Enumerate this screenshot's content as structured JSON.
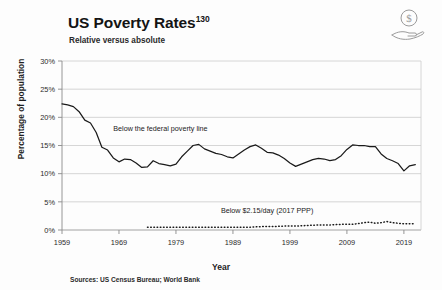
{
  "header": {
    "title": "US Poverty Rates",
    "title_superscript": "130",
    "subtitle": "Relative versus absolute",
    "icon": "hand-holding-dollar-icon"
  },
  "footer": {
    "sources": "Sources: US Census Bureau; World Bank"
  },
  "colors": {
    "background": "#fdfdfd",
    "line": "#1a1a1a",
    "gridline": "#cccccc",
    "axis": "#8a8a8a",
    "text": "#1a1a1a"
  },
  "chart_data": {
    "type": "line",
    "title": "US Poverty Rates",
    "subtitle": "Relative versus absolute",
    "xlabel": "Year",
    "ylabel": "Percentage of population",
    "xlim": [
      1959,
      2022
    ],
    "ylim": [
      0,
      30
    ],
    "xticks": [
      "1959",
      "1969",
      "1979",
      "1989",
      "1999",
      "2009",
      "2019"
    ],
    "xtick_values": [
      1959,
      1969,
      1979,
      1989,
      1999,
      2009,
      2019
    ],
    "yticks": [
      "0%",
      "5%",
      "10%",
      "15%",
      "20%",
      "25%",
      "30%"
    ],
    "ytick_values": [
      0,
      5,
      10,
      15,
      20,
      25,
      30
    ],
    "grid": "horizontal",
    "legend": "none",
    "annotations": [
      {
        "text": "Below the federal poverty line",
        "x": 1968,
        "y": 17.6
      },
      {
        "text": "Below $2.15/day (2017 PPP)",
        "x": 1995,
        "y": 3.1
      }
    ],
    "series": [
      {
        "name": "Below the federal poverty line",
        "style": "solid",
        "x": [
          1959,
          1960,
          1961,
          1962,
          1963,
          1964,
          1965,
          1966,
          1967,
          1968,
          1969,
          1970,
          1971,
          1972,
          1973,
          1974,
          1975,
          1976,
          1977,
          1978,
          1979,
          1980,
          1981,
          1982,
          1983,
          1984,
          1985,
          1986,
          1987,
          1988,
          1989,
          1990,
          1991,
          1992,
          1993,
          1994,
          1995,
          1996,
          1997,
          1998,
          1999,
          2000,
          2001,
          2002,
          2003,
          2004,
          2005,
          2006,
          2007,
          2008,
          2009,
          2010,
          2011,
          2012,
          2013,
          2014,
          2015,
          2016,
          2017,
          2018,
          2019,
          2020,
          2021
        ],
        "values": [
          22.4,
          22.2,
          21.9,
          21.0,
          19.5,
          19.0,
          17.3,
          14.7,
          14.2,
          12.8,
          12.1,
          12.6,
          12.5,
          11.9,
          11.1,
          11.2,
          12.3,
          11.8,
          11.6,
          11.4,
          11.7,
          13.0,
          14.0,
          15.0,
          15.2,
          14.4,
          14.0,
          13.6,
          13.4,
          13.0,
          12.8,
          13.5,
          14.2,
          14.8,
          15.1,
          14.5,
          13.8,
          13.7,
          13.3,
          12.7,
          11.9,
          11.3,
          11.7,
          12.1,
          12.5,
          12.7,
          12.6,
          12.3,
          12.5,
          13.2,
          14.3,
          15.1,
          15.0,
          15.0,
          14.8,
          14.8,
          13.5,
          12.7,
          12.3,
          11.8,
          10.5,
          11.4,
          11.6
        ]
      },
      {
        "name": "Below $2.15/day (2017 PPP)",
        "style": "dotted",
        "x": [
          1974,
          1976,
          1978,
          1980,
          1982,
          1984,
          1986,
          1988,
          1990,
          1992,
          1994,
          1996,
          1998,
          2000,
          2002,
          2004,
          2006,
          2008,
          2010,
          2012,
          2013,
          2014,
          2015,
          2016,
          2017,
          2018,
          2019,
          2020,
          2021
        ],
        "values": [
          0.5,
          0.5,
          0.5,
          0.5,
          0.5,
          0.5,
          0.5,
          0.5,
          0.5,
          0.5,
          0.6,
          0.6,
          0.7,
          0.7,
          0.8,
          0.9,
          0.9,
          1.0,
          1.0,
          1.3,
          1.4,
          1.2,
          1.3,
          1.5,
          1.3,
          1.2,
          1.1,
          1.1,
          1.1
        ]
      }
    ]
  }
}
